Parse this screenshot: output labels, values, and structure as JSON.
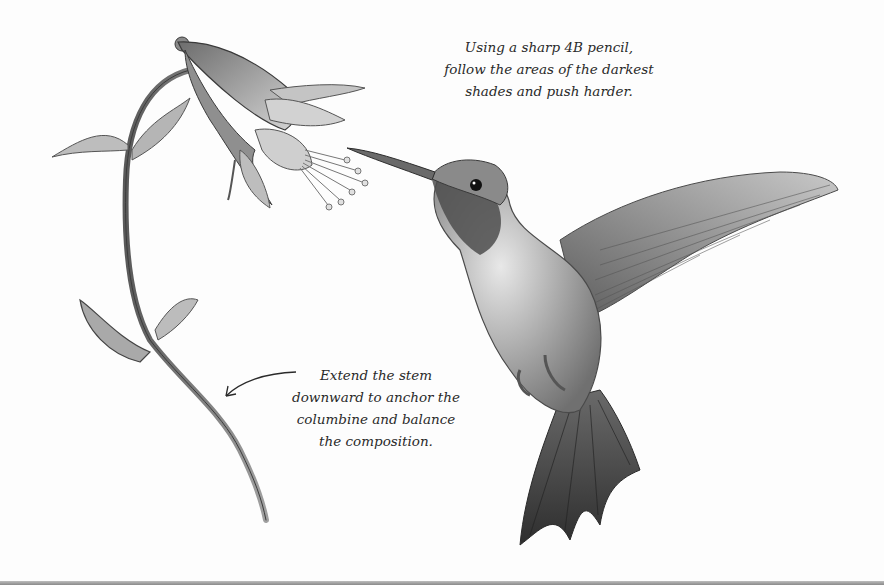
{
  "illustration": {
    "subject_flower": "columbine",
    "subject_bird": "hummingbird",
    "medium": "graphite pencil drawing"
  },
  "annotations": {
    "top": {
      "lines": [
        "Using a sharp 4B pencil,",
        "follow the areas of the darkest",
        "shades and push harder."
      ]
    },
    "bottom": {
      "lines": [
        "Extend the stem",
        "downward to anchor the",
        "columbine and balance",
        "the composition."
      ]
    }
  },
  "colors": {
    "background": "#fdfdfd",
    "text": "#2a2a2a",
    "graphite_dark": "#3a3a3a",
    "graphite_mid": "#8a8a8a",
    "graphite_light": "#c9c9c9"
  }
}
